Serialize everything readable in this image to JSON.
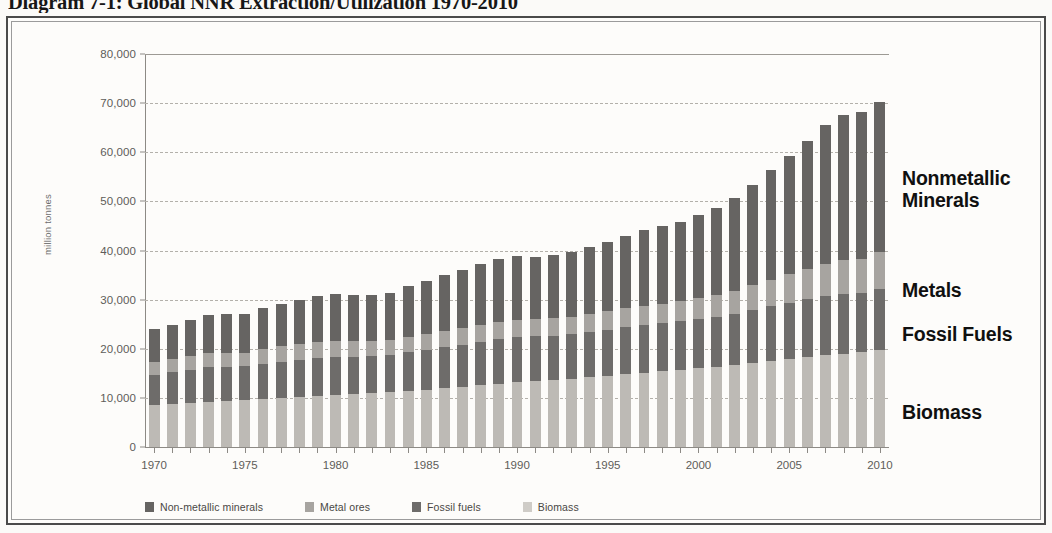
{
  "page": {
    "title": "Diagram 7-1: Global NNR Extraction/Utilization 1970-2010"
  },
  "colors": {
    "biomass": "#bdbab5",
    "fossil_fuels": "#6e6c6a",
    "metal_ores": "#a7a4a0",
    "nonmetallic_minerals": "#666462",
    "gridline": "#b3b0aa",
    "axis": "#8d8a85",
    "tick_text": "#5e5c59",
    "callout_text": "#101010",
    "frame": "#4a4a4a",
    "background": "#fdfcfa"
  },
  "legend": {
    "items": [
      {
        "label": "Non-metallic minerals",
        "color": "#666462"
      },
      {
        "label": "Metal ores",
        "color": "#a7a4a0"
      },
      {
        "label": "Fossil fuels",
        "color": "#6e6c6a"
      },
      {
        "label": "Biomass",
        "color": "#cfccc7"
      }
    ]
  },
  "callouts": [
    {
      "label": "Nonmetallic\nMinerals",
      "top": 128
    },
    {
      "label": "Metals",
      "top": 240
    },
    {
      "label": "Fossil Fuels",
      "top": 284
    },
    {
      "label": "Biomass",
      "top": 362
    }
  ],
  "chart_data": {
    "type": "bar",
    "stacked": true,
    "title": "Global NNR Extraction/Utilization 1970-2010",
    "xlabel": "",
    "ylabel": "million tonnes",
    "ylim": [
      0,
      80000
    ],
    "ytick_step": 10000,
    "yticks": [
      0,
      10000,
      20000,
      30000,
      40000,
      50000,
      60000,
      70000,
      80000
    ],
    "ytick_labels": [
      "0",
      "10,000",
      "20,000",
      "30,000",
      "40,000",
      "50,000",
      "60,000",
      "70,000",
      "80,000"
    ],
    "grid": true,
    "legend_position": "bottom",
    "xtick_labels": [
      "1970",
      "1975",
      "1980",
      "1985",
      "1990",
      "1995",
      "2000",
      "2005",
      "2010"
    ],
    "xtick_years": [
      1970,
      1975,
      1980,
      1985,
      1990,
      1995,
      2000,
      2005,
      2010
    ],
    "x": [
      1970,
      1971,
      1972,
      1973,
      1974,
      1975,
      1976,
      1977,
      1978,
      1979,
      1980,
      1981,
      1982,
      1983,
      1984,
      1985,
      1986,
      1987,
      1988,
      1989,
      1990,
      1991,
      1992,
      1993,
      1994,
      1995,
      1996,
      1997,
      1998,
      1999,
      2000,
      2001,
      2002,
      2003,
      2004,
      2005,
      2006,
      2007,
      2008,
      2009,
      2010
    ],
    "stack_order_bottom_to_top": [
      "Biomass",
      "Fossil fuels",
      "Metal ores",
      "Non-metallic minerals"
    ],
    "series": [
      {
        "name": "Biomass",
        "color": "#bdbab5",
        "values": [
          8600,
          8800,
          9000,
          9200,
          9300,
          9500,
          9700,
          9900,
          10100,
          10300,
          10500,
          10700,
          10900,
          11100,
          11400,
          11700,
          12000,
          12300,
          12600,
          12900,
          13200,
          13400,
          13600,
          13900,
          14200,
          14500,
          14800,
          15100,
          15400,
          15700,
          16000,
          16300,
          16700,
          17100,
          17500,
          17900,
          18300,
          18700,
          19000,
          19300,
          19700
        ]
      },
      {
        "name": "Fossil fuels",
        "color": "#6e6c6a",
        "values": [
          6100,
          6400,
          6700,
          7000,
          7000,
          6900,
          7300,
          7500,
          7700,
          7900,
          7900,
          7700,
          7600,
          7600,
          7900,
          8100,
          8300,
          8500,
          8800,
          9000,
          9100,
          9100,
          9100,
          9100,
          9200,
          9400,
          9600,
          9800,
          9800,
          9900,
          10100,
          10200,
          10400,
          10800,
          11200,
          11500,
          11800,
          12000,
          12200,
          12000,
          12400
        ]
      },
      {
        "name": "Metal ores",
        "color": "#a7a4a0",
        "values": [
          2600,
          2700,
          2800,
          2900,
          2900,
          2800,
          3000,
          3100,
          3100,
          3200,
          3200,
          3100,
          3000,
          3000,
          3100,
          3200,
          3300,
          3400,
          3500,
          3600,
          3600,
          3500,
          3500,
          3500,
          3600,
          3700,
          3800,
          3900,
          4000,
          4100,
          4300,
          4400,
          4600,
          5000,
          5400,
          5800,
          6200,
          6600,
          6900,
          6900,
          7700
        ]
      },
      {
        "name": "Non-metallic minerals",
        "color": "#666462",
        "values": [
          6700,
          6900,
          7300,
          7800,
          7800,
          7900,
          8400,
          8700,
          9000,
          9300,
          9500,
          9400,
          9400,
          9700,
          10300,
          10800,
          11400,
          11900,
          12400,
          12700,
          12900,
          12700,
          12800,
          13200,
          13700,
          14200,
          14800,
          15400,
          15700,
          16200,
          16900,
          17700,
          18900,
          20500,
          22300,
          24000,
          26000,
          28200,
          29500,
          30000,
          30400
        ]
      }
    ],
    "totals": [
      24000,
      24800,
      25800,
      26900,
      27000,
      27100,
      28400,
      29200,
      29900,
      30700,
      31100,
      30900,
      30900,
      31400,
      32700,
      33800,
      35000,
      36100,
      37300,
      38200,
      38800,
      38700,
      39000,
      39700,
      40700,
      41800,
      43000,
      44200,
      44900,
      45900,
      47300,
      48600,
      50600,
      53400,
      56400,
      59200,
      62300,
      65500,
      67600,
      68200,
      70200
    ]
  }
}
